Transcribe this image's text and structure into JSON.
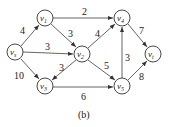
{
  "diagram": {
    "type": "directed-weighted-graph",
    "caption": "(b)",
    "nodes": [
      {
        "id": "vs",
        "base": "v",
        "sub": "s",
        "x": 15,
        "y": 52
      },
      {
        "id": "v1",
        "base": "v",
        "sub": "1",
        "x": 45,
        "y": 18
      },
      {
        "id": "v2",
        "base": "v",
        "sub": "2",
        "x": 82,
        "y": 54
      },
      {
        "id": "v3",
        "base": "v",
        "sub": "3",
        "x": 45,
        "y": 86
      },
      {
        "id": "v4",
        "base": "v",
        "sub": "4",
        "x": 122,
        "y": 18
      },
      {
        "id": "v5",
        "base": "v",
        "sub": "5",
        "x": 122,
        "y": 86
      },
      {
        "id": "vt",
        "base": "v",
        "sub": "t",
        "x": 153,
        "y": 54
      }
    ],
    "edges": [
      {
        "from": "vs",
        "to": "v1",
        "weight": "4"
      },
      {
        "from": "vs",
        "to": "v2",
        "weight": "3"
      },
      {
        "from": "vs",
        "to": "v3",
        "weight": "10"
      },
      {
        "from": "v1",
        "to": "v4",
        "weight": "2"
      },
      {
        "from": "v1",
        "to": "v2",
        "weight": "3"
      },
      {
        "from": "v2",
        "to": "v3",
        "weight": "3"
      },
      {
        "from": "v2",
        "to": "v4",
        "weight": "4"
      },
      {
        "from": "v2",
        "to": "v5",
        "weight": "5"
      },
      {
        "from": "v3",
        "to": "v5",
        "weight": "6"
      },
      {
        "from": "v5",
        "to": "v4",
        "weight": "3"
      },
      {
        "from": "v4",
        "to": "vt",
        "weight": "7"
      },
      {
        "from": "v5",
        "to": "vt",
        "weight": "8"
      }
    ]
  }
}
